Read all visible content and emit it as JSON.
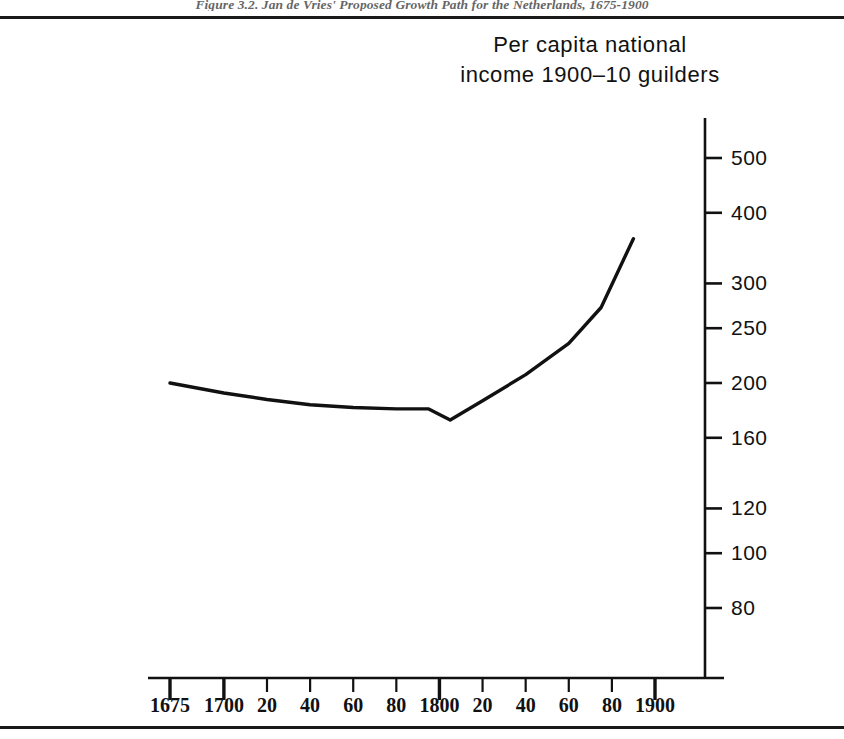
{
  "figure": {
    "caption": "Figure 3.2. Jan de Vries' Proposed Growth Path for the Netherlands, 1675-1900"
  },
  "chart_data": {
    "type": "line",
    "title": "",
    "subtitle": "",
    "ylabel_line1": "Per capita national",
    "ylabel_line2": "income 1900–10 guilders",
    "xlabel": "",
    "yscale": "log",
    "ylim": [
      70,
      560
    ],
    "xlim": [
      1668,
      1912
    ],
    "grid": false,
    "legend": false,
    "line_color": "#111111",
    "ytick_values": [
      500,
      400,
      300,
      250,
      200,
      160,
      120,
      100,
      80
    ],
    "ytick_labels": [
      "500",
      "400",
      "300",
      "250",
      "200",
      "160",
      "120",
      "100",
      "80"
    ],
    "xtick_values": [
      1675,
      1700,
      1720,
      1740,
      1760,
      1780,
      1800,
      1820,
      1840,
      1860,
      1880,
      1900
    ],
    "xtick_labels": [
      "1675",
      "1700",
      "20",
      "40",
      "60",
      "80",
      "1800",
      "20",
      "40",
      "60",
      "80",
      "1900"
    ],
    "x": [
      1675,
      1700,
      1720,
      1740,
      1760,
      1780,
      1795,
      1805,
      1820,
      1840,
      1860,
      1875,
      1890
    ],
    "values": [
      200,
      192,
      187,
      183,
      181,
      180,
      180,
      172,
      186,
      207,
      235,
      272,
      360
    ],
    "series": [
      {
        "name": "Per capita national income",
        "values": [
          200,
          192,
          187,
          183,
          181,
          180,
          180,
          172,
          186,
          207,
          235,
          272,
          360
        ]
      }
    ]
  }
}
